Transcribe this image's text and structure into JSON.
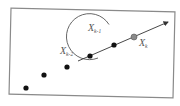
{
  "diagram": {
    "frame": {
      "x1": 10,
      "y1": 10,
      "x2": 174,
      "y2": 96,
      "stroke": "#8a8a8a"
    },
    "points": [
      {
        "cx": 26,
        "cy": 88,
        "r": 2.6,
        "fill": "#111111"
      },
      {
        "cx": 44,
        "cy": 75,
        "r": 2.6,
        "fill": "#111111"
      },
      {
        "cx": 67,
        "cy": 67,
        "r": 2.6,
        "fill": "#111111"
      },
      {
        "cx": 90,
        "cy": 56,
        "r": 2.6,
        "fill": "#111111"
      },
      {
        "cx": 114,
        "cy": 45,
        "r": 2.6,
        "fill": "#111111"
      },
      {
        "cx": 134,
        "cy": 37,
        "r": 3.0,
        "fill": "#8a8a8a"
      }
    ],
    "arrow": {
      "x1": 78,
      "y1": 61,
      "x2": 168,
      "y2": 22,
      "stroke": "#333333"
    },
    "circle": {
      "cx": 118,
      "cy": 46,
      "r": 23,
      "stroke": "#555555"
    },
    "labels": [
      {
        "id": "x_k_minus_2",
        "base": "X",
        "sub": "k-2",
        "x": 60,
        "y": 54
      },
      {
        "id": "x_k_minus_1",
        "base": "X",
        "sub": "k-1",
        "x": 88,
        "y": 31
      },
      {
        "id": "x_k",
        "base": "X",
        "sub": "k",
        "x": 139,
        "y": 46
      }
    ]
  }
}
